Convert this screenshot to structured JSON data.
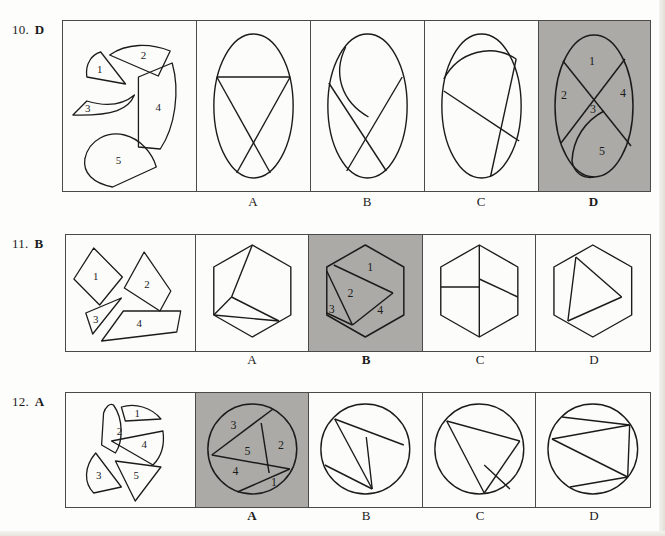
{
  "page": {
    "background": "#fdfdfb",
    "ink": "#1b1b1b",
    "shade_color": "#abaaa6",
    "border_color": "#4a4a4a"
  },
  "questions": [
    {
      "id": "q10",
      "number": "10.",
      "answer": "D",
      "shape_kind": "ellipse",
      "pieces_count": 5,
      "piece_labels": [
        "1",
        "2",
        "3",
        "4",
        "5"
      ],
      "options": [
        {
          "letter": "A",
          "shaded": false,
          "region_labels": []
        },
        {
          "letter": "B",
          "shaded": false,
          "region_labels": []
        },
        {
          "letter": "C",
          "shaded": false,
          "region_labels": []
        },
        {
          "letter": "D",
          "shaded": true,
          "region_labels": [
            "1",
            "2",
            "3",
            "4",
            "5"
          ]
        }
      ]
    },
    {
      "id": "q11",
      "number": "11.",
      "answer": "B",
      "shape_kind": "hexagon",
      "pieces_count": 4,
      "piece_labels": [
        "1",
        "2",
        "3",
        "4"
      ],
      "options": [
        {
          "letter": "A",
          "shaded": false,
          "region_labels": []
        },
        {
          "letter": "B",
          "shaded": true,
          "region_labels": [
            "1",
            "2",
            "3",
            "4"
          ]
        },
        {
          "letter": "C",
          "shaded": false,
          "region_labels": []
        },
        {
          "letter": "D",
          "shaded": false,
          "region_labels": []
        }
      ]
    },
    {
      "id": "q12",
      "number": "12.",
      "answer": "A",
      "shape_kind": "circle",
      "pieces_count": 5,
      "piece_labels": [
        "1",
        "2",
        "3",
        "4",
        "5"
      ],
      "options": [
        {
          "letter": "A",
          "shaded": true,
          "region_labels": [
            "1",
            "2",
            "3",
            "4",
            "5"
          ]
        },
        {
          "letter": "B",
          "shaded": false,
          "region_labels": []
        },
        {
          "letter": "C",
          "shaded": false,
          "region_labels": []
        },
        {
          "letter": "D",
          "shaded": false,
          "region_labels": []
        }
      ]
    }
  ]
}
